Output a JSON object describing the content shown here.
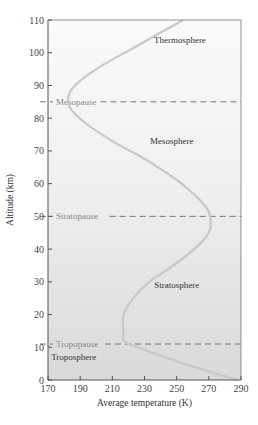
{
  "chart_data": {
    "type": "line",
    "title": "",
    "xlabel": "Average temperature (K)",
    "ylabel": "Altitude (km)",
    "xlim": [
      170,
      290
    ],
    "ylim": [
      0,
      110
    ],
    "x_ticks": [
      170,
      190,
      210,
      230,
      250,
      270,
      290
    ],
    "y_ticks": [
      0,
      10,
      20,
      30,
      40,
      50,
      60,
      70,
      80,
      90,
      100,
      110
    ],
    "grid": false,
    "series": [
      {
        "name": "Temperature profile",
        "points": [
          {
            "temperature": 288,
            "altitude": 0
          },
          {
            "temperature": 254,
            "altitude": 5
          },
          {
            "temperature": 220,
            "altitude": 11
          },
          {
            "temperature": 217,
            "altitude": 15
          },
          {
            "temperature": 217,
            "altitude": 20
          },
          {
            "temperature": 223,
            "altitude": 25
          },
          {
            "temperature": 233,
            "altitude": 30
          },
          {
            "temperature": 248,
            "altitude": 35
          },
          {
            "temperature": 261,
            "altitude": 40
          },
          {
            "temperature": 270,
            "altitude": 45
          },
          {
            "temperature": 271,
            "altitude": 49
          },
          {
            "temperature": 268,
            "altitude": 53
          },
          {
            "temperature": 253,
            "altitude": 60
          },
          {
            "temperature": 232,
            "altitude": 67
          },
          {
            "temperature": 210,
            "altitude": 73
          },
          {
            "temperature": 192,
            "altitude": 79
          },
          {
            "temperature": 183,
            "altitude": 84
          },
          {
            "temperature": 185,
            "altitude": 89
          },
          {
            "temperature": 200,
            "altitude": 95
          },
          {
            "temperature": 225,
            "altitude": 102
          },
          {
            "temperature": 254,
            "altitude": 110
          }
        ]
      }
    ],
    "reference_lines": [
      {
        "label": "Tropopause",
        "altitude": 11
      },
      {
        "label": "Stratopause",
        "altitude": 50
      },
      {
        "label": "Mesopause",
        "altitude": 85
      }
    ],
    "annotations": [
      {
        "text": "Troposphere",
        "temperature": 186,
        "altitude": 6
      },
      {
        "text": "Stratosphere",
        "temperature": 250,
        "altitude": 28
      },
      {
        "text": "Mesosphere",
        "temperature": 247,
        "altitude": 72
      },
      {
        "text": "Thermosphere",
        "temperature": 252,
        "altitude": 103
      }
    ]
  }
}
